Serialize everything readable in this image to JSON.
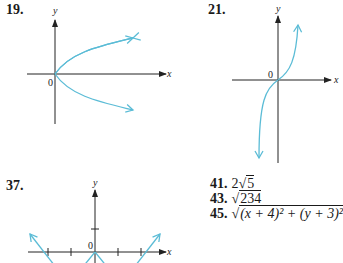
{
  "problems": [
    {
      "number": "19.",
      "x_label": "x",
      "y_label": "y",
      "origin_label": "0"
    },
    {
      "number": "21.",
      "x_label": "x",
      "y_label": "y",
      "origin_label": "0"
    },
    {
      "number": "37.",
      "x_label": "x",
      "y_label": "y",
      "origin_label": "0"
    }
  ],
  "answers": [
    {
      "number": "41.",
      "coef": "2",
      "radicand": "5"
    },
    {
      "number": "43.",
      "coef": "",
      "radicand": "234"
    },
    {
      "number": "45.",
      "coef": "",
      "radicand": "(x + 4)² + (y + 3)²"
    }
  ],
  "colors": {
    "curve": "#5bbcd6",
    "axis": "#222222"
  }
}
